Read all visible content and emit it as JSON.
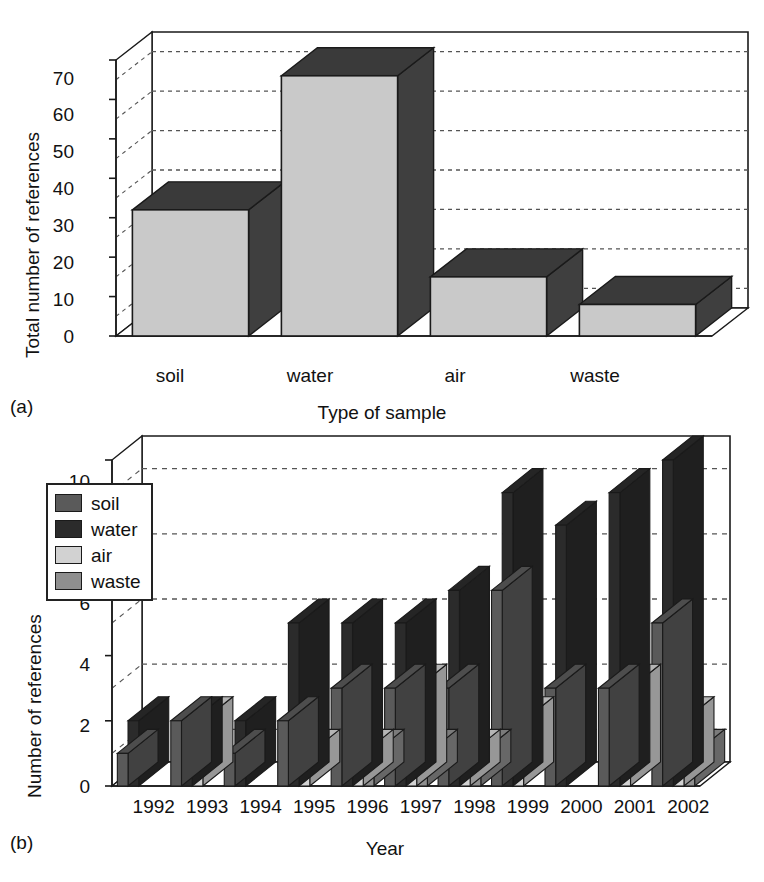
{
  "figure": {
    "panel_a_tag": "(a)",
    "panel_b_tag": "(b)"
  },
  "colors": {
    "soil": "#5a5a5a",
    "water": "#2b2b2b",
    "air": "#d2d2d2",
    "waste": "#8f8f8f",
    "bar_top": "#3a3a3a",
    "bar_side": "#3f3f3f",
    "panel_a_face": "#c9c9c9",
    "axis": "#1a1a1a",
    "grid": "#555555",
    "background": "#ffffff"
  },
  "chart_data": [
    {
      "type": "bar",
      "id": "panel-a",
      "title": "",
      "xlabel": "Type of sample",
      "ylabel": "Total number of references",
      "categories": [
        "soil",
        "water",
        "air",
        "waste"
      ],
      "values": [
        32,
        66,
        15,
        8
      ],
      "ylim": [
        0,
        70
      ],
      "yticks": [
        0,
        10,
        20,
        30,
        40,
        50,
        60,
        70
      ],
      "ytick_labels": [
        "0",
        "10",
        "20",
        "30",
        "40",
        "50",
        "60",
        "70"
      ],
      "gridlines": [
        5,
        15,
        25,
        35,
        45,
        55,
        65
      ],
      "grid": true,
      "legend": "none",
      "style": "3d-isometric"
    },
    {
      "type": "bar",
      "id": "panel-b",
      "title": "",
      "xlabel": "Year",
      "ylabel": "Number of references",
      "categories": [
        "1992",
        "1993",
        "1994",
        "1995",
        "1996",
        "1997",
        "1998",
        "1999",
        "2000",
        "2001",
        "2002"
      ],
      "series": [
        {
          "name": "soil",
          "color": "#5a5a5a",
          "values": [
            1,
            2,
            1,
            2,
            3,
            3,
            3,
            6,
            3,
            3,
            5
          ]
        },
        {
          "name": "water",
          "color": "#2b2b2b",
          "values": [
            2,
            2,
            2,
            5,
            5,
            5,
            6,
            9,
            8,
            9,
            10
          ]
        },
        {
          "name": "air",
          "color": "#d2d2d2",
          "values": [
            0,
            2,
            0,
            1,
            1,
            3,
            1,
            2,
            0,
            3,
            2
          ]
        },
        {
          "name": "waste",
          "color": "#8f8f8f",
          "values": [
            0,
            0,
            0,
            0,
            1,
            1,
            1,
            0,
            0,
            0,
            1
          ]
        }
      ],
      "ylim": [
        0,
        10
      ],
      "yticks": [
        0,
        2,
        4,
        6,
        8,
        10
      ],
      "ytick_labels": [
        "0",
        "2",
        "4",
        "6",
        "8",
        "10"
      ],
      "gridlines": [
        1,
        3,
        5,
        7,
        9
      ],
      "grid": true,
      "legend": "upper-left-inside",
      "legend_entries": [
        "soil",
        "water",
        "air",
        "waste"
      ],
      "style": "3d-isometric"
    }
  ]
}
